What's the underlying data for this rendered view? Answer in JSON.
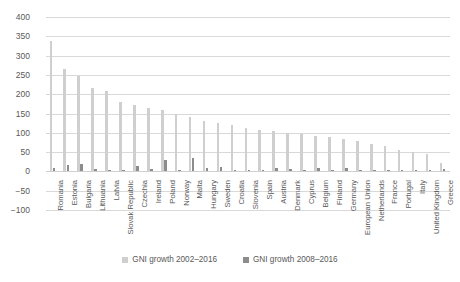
{
  "chart_data": {
    "type": "bar",
    "title": "",
    "xlabel": "",
    "ylabel": "",
    "ylim": [
      -100,
      400
    ],
    "yticks": [
      400,
      350,
      300,
      250,
      200,
      150,
      100,
      50,
      0,
      -50,
      -100
    ],
    "ytick_labels": [
      "400",
      "350",
      "300",
      "250",
      "200",
      "150",
      "100",
      "50",
      "0",
      "−50",
      "−100"
    ],
    "grid": true,
    "legend_position": "bottom",
    "colors": {
      "series_a": "#cfcfcf",
      "series_b": "#8c8c8c",
      "gridline": "#d9d9d9",
      "text": "#595959"
    },
    "categories": [
      "Romania",
      "Estonia",
      "Bulgaria",
      "Lithuania",
      "Latvia",
      "Slovak Republic",
      "Czechia",
      "Ireland",
      "Poland",
      "Norway",
      "Malta",
      "Hungary",
      "Sweden",
      "Croatia",
      "Slovenia",
      "Spain",
      "Austria",
      "Denmark",
      "Cyprus",
      "Belgium",
      "Finland",
      "Germany",
      "European Union",
      "Netherlands",
      "France",
      "Portugal",
      "Italy",
      "United Kingdom",
      "Greece"
    ],
    "series": [
      {
        "name": "GNI growth 2002–2016",
        "color": "#cfcfcf",
        "values": [
          338,
          265,
          247,
          217,
          209,
          180,
          172,
          165,
          160,
          148,
          140,
          131,
          126,
          120,
          113,
          108,
          104,
          100,
          96,
          92,
          88,
          84,
          78,
          72,
          66,
          56,
          50,
          44,
          22
        ]
      },
      {
        "name": "GNI growth 2008–2016",
        "color": "#8c8c8c",
        "values": [
          9,
          16,
          18,
          6,
          4,
          3,
          13,
          6,
          30,
          4,
          35,
          9,
          11,
          2,
          4,
          3,
          9,
          6,
          3,
          8,
          4,
          9,
          4,
          4,
          4,
          3,
          2,
          4,
          5
        ]
      }
    ]
  },
  "legend": {
    "items": [
      {
        "label": "GNI growth 2002–2016",
        "color": "#cfcfcf"
      },
      {
        "label": "GNI growth 2008–2016",
        "color": "#8c8c8c"
      }
    ]
  }
}
